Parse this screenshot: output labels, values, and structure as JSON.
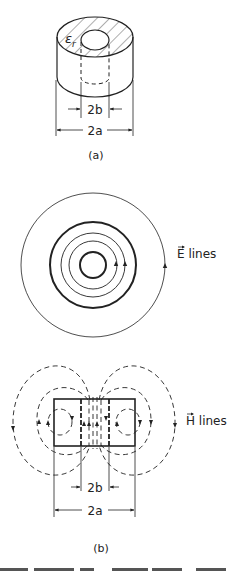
{
  "figure_a": {
    "label": "(a)",
    "permittivity_symbol": "ε",
    "permittivity_subscript": "r",
    "inner_dimension": "2b",
    "outer_dimension": "2a"
  },
  "figure_e": {
    "field_vector": "E",
    "field_label": " lines"
  },
  "figure_b": {
    "label": "(b)",
    "field_vector": "H",
    "field_label": " lines",
    "inner_dimension": "2b",
    "outer_dimension": "2a"
  },
  "colors": {
    "ink": "#222222",
    "background": "#ffffff"
  }
}
